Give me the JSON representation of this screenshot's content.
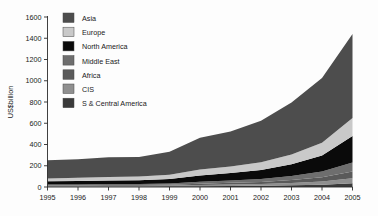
{
  "chart_data": {
    "type": "area",
    "title": "",
    "xlabel": "",
    "ylabel": "US$billion",
    "ylim": [
      0,
      1600
    ],
    "yticks": [
      0,
      200,
      400,
      600,
      800,
      1000,
      1200,
      1400,
      1600
    ],
    "categories": [
      "1995",
      "1996",
      "1997",
      "1998",
      "1999",
      "2000",
      "2001",
      "2002",
      "2003",
      "2004",
      "2005"
    ],
    "x": [
      1995,
      1996,
      1997,
      1998,
      1999,
      2000,
      2001,
      2002,
      2003,
      2004,
      2005
    ],
    "grid": false,
    "legend_position": "top-left-inside",
    "stacked": true,
    "stack_order_bottom_to_top": [
      "S & Central America",
      "CIS",
      "Africa",
      "Middle East",
      "North America",
      "Europe",
      "Asia"
    ],
    "series": [
      {
        "name": "Asia",
        "color": "#4d4d4d",
        "values": [
          170,
          175,
          185,
          185,
          215,
          300,
          330,
          390,
          490,
          610,
          790
        ]
      },
      {
        "name": "Europe",
        "color": "#c9c9c9",
        "values": [
          28,
          30,
          32,
          34,
          40,
          55,
          62,
          72,
          92,
          120,
          170
        ]
      },
      {
        "name": "North America",
        "color": "#0a0a0a",
        "values": [
          30,
          32,
          34,
          36,
          42,
          60,
          70,
          85,
          110,
          150,
          250
        ]
      },
      {
        "name": "Middle East",
        "color": "#6e6e6e",
        "values": [
          8,
          9,
          10,
          10,
          12,
          18,
          22,
          28,
          38,
          55,
          85
        ]
      },
      {
        "name": "Africa",
        "color": "#5a5a5a",
        "values": [
          6,
          6,
          7,
          7,
          9,
          13,
          16,
          20,
          28,
          40,
          62
        ]
      },
      {
        "name": "CIS",
        "color": "#8f8f8f",
        "values": [
          5,
          5,
          6,
          6,
          7,
          10,
          13,
          16,
          22,
          30,
          48
        ]
      },
      {
        "name": "S & Central America",
        "color": "#3a3a3a",
        "values": [
          4,
          4,
          5,
          5,
          6,
          8,
          10,
          12,
          16,
          22,
          35
        ]
      }
    ],
    "totals": [
      251,
      261,
      279,
      283,
      331,
      464,
      523,
      623,
      796,
      1027,
      1440
    ]
  },
  "legend": {
    "items": [
      {
        "label": "Asia",
        "color": "#4d4d4d"
      },
      {
        "label": "Europe",
        "color": "#c9c9c9"
      },
      {
        "label": "North America",
        "color": "#0a0a0a"
      },
      {
        "label": "Middle East",
        "color": "#6e6e6e"
      },
      {
        "label": "Africa",
        "color": "#5a5a5a"
      },
      {
        "label": "CIS",
        "color": "#8f8f8f"
      },
      {
        "label": "S & Central America",
        "color": "#3a3a3a"
      }
    ]
  },
  "axes": {
    "y_title": "US$billion",
    "y_labels": [
      "1600",
      "1400",
      "1200",
      "1000",
      "800",
      "600",
      "400",
      "200",
      "0"
    ],
    "x_labels": [
      "1995",
      "1996",
      "1997",
      "1998",
      "1999",
      "2000",
      "2001",
      "2002",
      "2003",
      "2004",
      "2005"
    ]
  }
}
